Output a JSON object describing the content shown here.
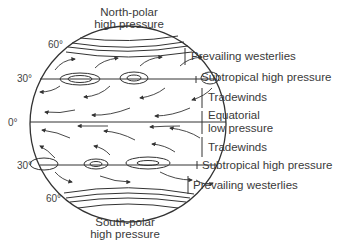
{
  "diagram": {
    "title_top": [
      "North-polar",
      "high pressure"
    ],
    "title_bottom": [
      "South-polar",
      "high pressure"
    ],
    "latitudes": [
      "60°",
      "30°",
      "0°",
      "30°",
      "60°"
    ],
    "zones": [
      {
        "label": "Prevailing westerlies"
      },
      {
        "label": "Subtropical high pressure"
      },
      {
        "label": "Tradewinds"
      },
      {
        "label_line1": "Equatorial",
        "label_line2": "low pressure"
      },
      {
        "label": "Tradewinds"
      },
      {
        "label": "Subtropical high pressure"
      },
      {
        "label": "Prevailing westerlies"
      }
    ],
    "colors": {
      "ink": "#333333",
      "background": "#ffffff"
    }
  }
}
